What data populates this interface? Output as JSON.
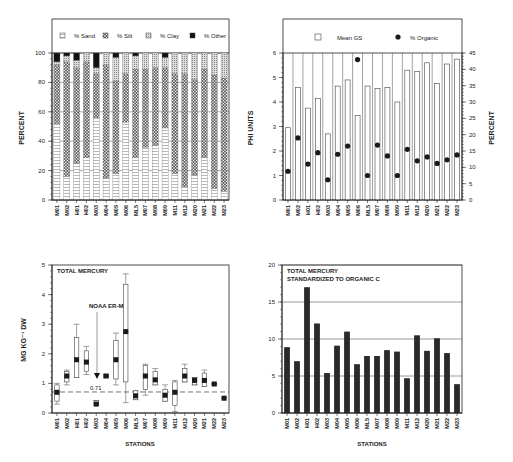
{
  "stations": [
    "M01",
    "M02",
    "H01",
    "H02",
    "M03",
    "M04",
    "M05",
    "M06",
    "ML5",
    "M07",
    "M08",
    "M09",
    "M11",
    "M12",
    "M20",
    "M21",
    "M22",
    "M23"
  ],
  "chart_data": [
    {
      "id": "grain-size-composition",
      "type": "bar",
      "stacked": true,
      "categories": [
        "M01",
        "M02",
        "H01",
        "H02",
        "M03",
        "M04",
        "M05",
        "M06",
        "ML5",
        "M07",
        "M08",
        "M09",
        "M11",
        "M12",
        "M20",
        "M21",
        "M22",
        "M23"
      ],
      "series": [
        {
          "name": "% Sand",
          "values": [
            52,
            16,
            25,
            29,
            56,
            15,
            18,
            53,
            29,
            36,
            37,
            49,
            18,
            9,
            17,
            29,
            8,
            6
          ]
        },
        {
          "name": "% Silt",
          "values": [
            40,
            78,
            65,
            65,
            30,
            77,
            63,
            33,
            60,
            53,
            53,
            41,
            68,
            77,
            65,
            60,
            77,
            77
          ]
        },
        {
          "name": "% Clay",
          "values": [
            2,
            4,
            5,
            6,
            4,
            8,
            16,
            14,
            9,
            11,
            10,
            7,
            14,
            14,
            18,
            11,
            15,
            17
          ]
        },
        {
          "name": "% Other",
          "values": [
            6,
            2,
            5,
            0,
            10,
            0,
            3,
            0,
            2,
            0,
            0,
            3,
            0,
            0,
            0,
            0,
            0,
            0
          ]
        }
      ],
      "title": "",
      "xlabel": "",
      "ylabel": "PERCENT",
      "yticks": [
        0,
        20,
        40,
        60,
        80,
        100
      ],
      "ylim": [
        0,
        100
      ],
      "grid": true,
      "legend_position": "top"
    },
    {
      "id": "mean-grain-size-organic",
      "type": "bar+scatter",
      "categories": [
        "M01",
        "M02",
        "H01",
        "H02",
        "M03",
        "M04",
        "M05",
        "M06",
        "ML5",
        "M07",
        "M08",
        "M09",
        "M11",
        "M12",
        "M20",
        "M21",
        "M22",
        "M23"
      ],
      "series": [
        {
          "name": "Mean GS",
          "axis": "left",
          "values": [
            2.95,
            4.6,
            3.75,
            4.15,
            2.7,
            4.65,
            4.9,
            3.45,
            4.65,
            4.55,
            4.6,
            4.0,
            5.3,
            5.25,
            5.6,
            4.75,
            5.55,
            5.75
          ]
        },
        {
          "name": "% Organic",
          "axis": "right",
          "values": [
            8.8,
            19,
            11,
            14.5,
            6.2,
            14,
            16.5,
            43,
            7.5,
            16.8,
            13.5,
            7.5,
            15.5,
            12,
            13.2,
            11.2,
            12.3,
            13.8
          ]
        }
      ],
      "ylabel": "PHI UNITS",
      "ylim": [
        0,
        6
      ],
      "yticks": [
        0,
        1,
        2,
        3,
        4,
        5,
        6
      ],
      "y2label": "PERCENT",
      "y2lim": [
        0,
        45
      ],
      "y2ticks": [
        0,
        5,
        10,
        15,
        20,
        25,
        30,
        35,
        40,
        45
      ],
      "legend_position": "top"
    },
    {
      "id": "total-mercury-boxplot",
      "type": "box",
      "categories": [
        "M01",
        "M02",
        "H01",
        "H02",
        "M03",
        "M04",
        "M05",
        "M06",
        "ML5",
        "M07",
        "M08",
        "M09",
        "M11",
        "M12",
        "M20",
        "M21",
        "M22",
        "M23"
      ],
      "boxes": [
        {
          "min": 0.3,
          "q1": 0.4,
          "median": 0.7,
          "q3": 0.95,
          "max": 1.0
        },
        {
          "min": 0.95,
          "q1": 1.05,
          "median": 1.25,
          "q3": 1.4,
          "max": 1.45
        },
        {
          "min": 1.2,
          "q1": 1.2,
          "median": 1.8,
          "q3": 2.55,
          "max": 3.0
        },
        {
          "min": 1.3,
          "q1": 1.4,
          "median": 1.72,
          "q3": 2.1,
          "max": 2.25
        },
        {
          "min": 0.28,
          "q1": 0.28,
          "median": 0.3,
          "q3": 0.42,
          "max": 0.42
        },
        {
          "min": 1.2,
          "q1": 1.2,
          "median": 1.25,
          "q3": 1.3,
          "max": 1.3
        },
        {
          "min": 0.95,
          "q1": 1.15,
          "median": 1.8,
          "q3": 2.45,
          "max": 2.7
        },
        {
          "min": 0.35,
          "q1": 1.05,
          "median": 2.75,
          "q3": 4.35,
          "max": 4.7
        },
        {
          "min": 0.45,
          "q1": 0.45,
          "median": 0.58,
          "q3": 0.75,
          "max": 0.75
        },
        {
          "min": 0.6,
          "q1": 0.8,
          "median": 1.25,
          "q3": 1.6,
          "max": 1.65
        },
        {
          "min": 0.95,
          "q1": 0.95,
          "median": 1.12,
          "q3": 1.4,
          "max": 1.5
        },
        {
          "min": 0.4,
          "q1": 0.4,
          "median": 0.6,
          "q3": 0.8,
          "max": 0.95
        },
        {
          "min": 0.05,
          "q1": 0.25,
          "median": 0.7,
          "q3": 1.05,
          "max": 1.1
        },
        {
          "min": 1.05,
          "q1": 1.05,
          "median": 1.25,
          "q3": 1.5,
          "max": 1.65
        },
        {
          "min": 0.95,
          "q1": 0.95,
          "median": 1.1,
          "q3": 1.2,
          "max": 1.2
        },
        {
          "min": 0.9,
          "q1": 0.9,
          "median": 1.1,
          "q3": 1.35,
          "max": 1.45
        },
        {
          "min": 0.95,
          "q1": 0.95,
          "median": 0.98,
          "q3": 1.0,
          "max": 1.0
        },
        {
          "min": 0.5,
          "q1": 0.5,
          "median": 0.5,
          "q3": 0.5,
          "max": 0.5
        }
      ],
      "title": "TOTAL MERCURY",
      "xlabel": "STATIONS",
      "ylabel": "MG KG-1 DW",
      "ylim": [
        0,
        5
      ],
      "yticks": [
        0,
        1,
        2,
        3,
        4,
        5
      ],
      "reference_line": {
        "value": 0.71,
        "label": "NOAA ER-M",
        "value_label": "0.71",
        "style": "dashed"
      }
    },
    {
      "id": "mercury-standardized-organic-c",
      "type": "bar",
      "categories": [
        "M01",
        "M02",
        "H01",
        "H02",
        "M03",
        "M04",
        "M05",
        "M06",
        "ML5",
        "M07",
        "M08",
        "M09",
        "M11",
        "M12",
        "M20",
        "M21",
        "M22",
        "M23"
      ],
      "values": [
        8.9,
        7.0,
        17.0,
        12.1,
        5.4,
        9.1,
        11.0,
        6.6,
        7.7,
        7.7,
        8.5,
        8.3,
        4.7,
        10.5,
        8.4,
        10.1,
        8.1,
        3.9
      ],
      "title": "TOTAL MERCURY\nSTANDARDIZED TO ORGANIC C",
      "title_lines": [
        "TOTAL MERCURY",
        "STANDARDIZED TO ORGANIC C"
      ],
      "xlabel": "STATIONS",
      "ylabel": "",
      "ylim": [
        0,
        20
      ],
      "yticks": [
        0,
        5,
        10,
        15,
        20
      ],
      "grid": true
    }
  ],
  "labels": {
    "tl_ylabel": "PERCENT",
    "tl_legend": [
      "% Sand",
      "% Silt",
      "% Clay",
      "% Other"
    ],
    "tr_ylabel": "PHI UNITS",
    "tr_y2label": "PERCENT",
    "tr_legend": [
      "Mean GS",
      "% Organic"
    ],
    "bl_title": "TOTAL MERCURY",
    "bl_ylabel": "MG KG⁻¹ DW",
    "bl_ref_label": "NOAA ER-M",
    "bl_ref_value": "0.71",
    "bl_xlabel": "STATIONS",
    "br_title1": "TOTAL MERCURY",
    "br_title2": "STANDARDIZED TO ORGANIC C",
    "br_xlabel": "STATIONS"
  },
  "colors": {
    "ink": "#222222",
    "bar_dark": "#2a2a2a",
    "grid": "#555555"
  }
}
